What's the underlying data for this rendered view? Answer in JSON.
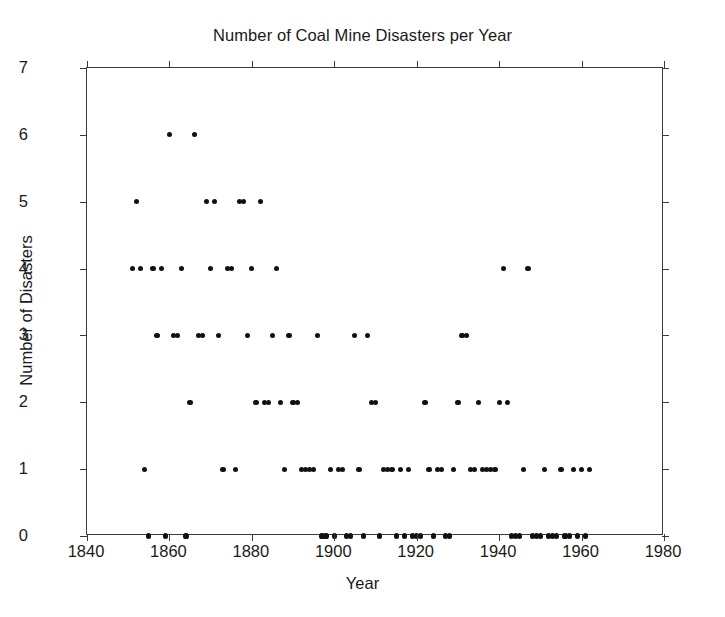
{
  "chart_data": {
    "type": "scatter",
    "title": "Number of Coal Mine Disasters per Year",
    "xlabel": "Year",
    "ylabel": "Number of Disasters",
    "xlim": [
      1840,
      1980
    ],
    "ylim": [
      0,
      7
    ],
    "xticks": [
      1840,
      1860,
      1880,
      1900,
      1920,
      1940,
      1960,
      1980
    ],
    "xtick_labels": [
      "1840",
      "1860",
      "1880",
      "1900",
      "1920",
      "1940",
      "1960",
      "1980"
    ],
    "yticks": [
      0,
      1,
      2,
      3,
      4,
      5,
      6,
      7
    ],
    "ytick_labels": [
      "0",
      "1",
      "2",
      "3",
      "4",
      "5",
      "6",
      "7"
    ],
    "grid": false,
    "legend": null,
    "marker": "filled-circle",
    "marker_color": "#111111",
    "frame_color": "#3a3a3a",
    "background_color": "#ffffff",
    "x": [
      1851,
      1852,
      1853,
      1854,
      1855,
      1856,
      1857,
      1858,
      1859,
      1860,
      1861,
      1862,
      1863,
      1864,
      1865,
      1866,
      1867,
      1868,
      1869,
      1870,
      1871,
      1872,
      1873,
      1874,
      1875,
      1876,
      1877,
      1878,
      1879,
      1880,
      1881,
      1882,
      1883,
      1884,
      1885,
      1886,
      1887,
      1888,
      1889,
      1890,
      1891,
      1892,
      1893,
      1894,
      1895,
      1896,
      1897,
      1898,
      1899,
      1900,
      1901,
      1902,
      1903,
      1904,
      1905,
      1906,
      1907,
      1908,
      1909,
      1910,
      1911,
      1912,
      1913,
      1914,
      1915,
      1916,
      1917,
      1918,
      1919,
      1920,
      1921,
      1922,
      1923,
      1924,
      1925,
      1926,
      1927,
      1928,
      1929,
      1930,
      1931,
      1932,
      1933,
      1934,
      1935,
      1936,
      1937,
      1938,
      1939,
      1940,
      1941,
      1942,
      1943,
      1944,
      1945,
      1946,
      1947,
      1948,
      1949,
      1950,
      1951,
      1952,
      1953,
      1954,
      1955,
      1956,
      1957,
      1958,
      1959,
      1960,
      1961,
      1962
    ],
    "y": [
      4,
      5,
      4,
      1,
      0,
      4,
      3,
      4,
      0,
      6,
      3,
      3,
      4,
      0,
      2,
      6,
      3,
      3,
      5,
      4,
      5,
      3,
      1,
      4,
      4,
      1,
      5,
      5,
      3,
      4,
      2,
      5,
      2,
      2,
      3,
      4,
      2,
      1,
      3,
      2,
      2,
      1,
      1,
      1,
      1,
      3,
      0,
      0,
      1,
      0,
      1,
      1,
      0,
      0,
      3,
      1,
      0,
      3,
      2,
      2,
      0,
      1,
      1,
      1,
      0,
      1,
      0,
      1,
      0,
      0,
      0,
      2,
      1,
      0,
      1,
      1,
      0,
      0,
      1,
      2,
      3,
      3,
      1,
      1,
      2,
      1,
      1,
      1,
      1,
      2,
      4,
      2,
      0,
      0,
      0,
      1,
      4,
      0,
      0,
      0,
      1,
      0,
      0,
      0,
      1,
      0,
      0,
      1,
      0,
      1,
      0,
      1
    ]
  },
  "chart": {
    "title": "Number of Coal Mine Disasters per Year",
    "x_axis_title": "Year",
    "y_axis_title": "Number of Disasters",
    "x_tick_labels": [
      "1840",
      "1860",
      "1880",
      "1900",
      "1920",
      "1940",
      "1960",
      "1980"
    ],
    "y_tick_labels": [
      "7",
      "6",
      "5",
      "4",
      "3",
      "2",
      "1",
      "0"
    ],
    "accent_color": "#111111",
    "frame_color": "#3a3a3a"
  }
}
